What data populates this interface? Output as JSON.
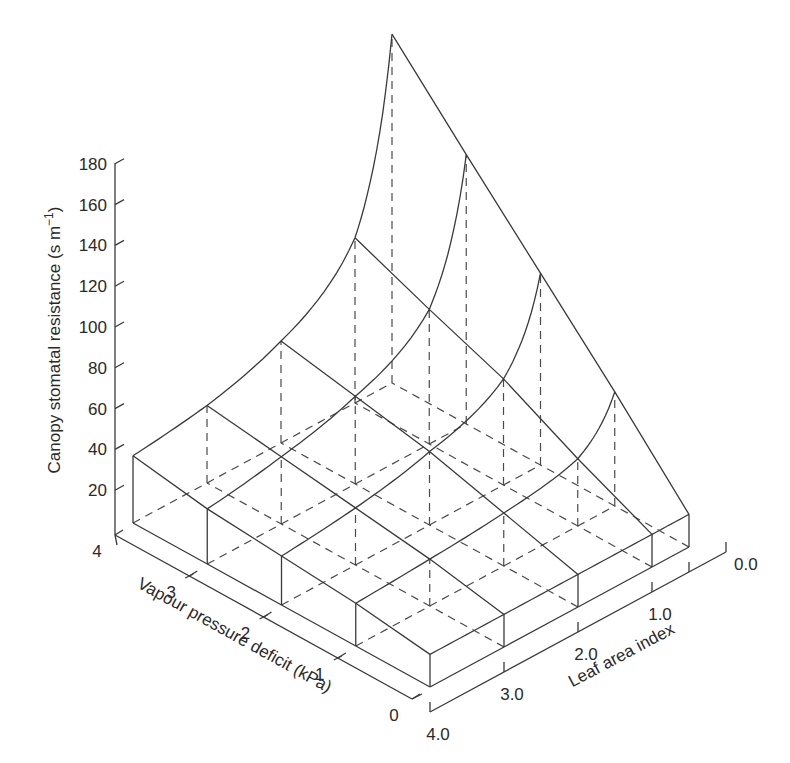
{
  "chart_data": {
    "type": "surface3d",
    "title": "",
    "zlabel": "Canopy stomatal resistance (s m⁻¹)",
    "xlabel": "Vapour pressure deficit (kPa)",
    "ylabel": "Leaf area index",
    "z_ticks": [
      20,
      40,
      60,
      80,
      100,
      120,
      140,
      160,
      180
    ],
    "z_tick_labels": [
      "20",
      "40",
      "60",
      "80",
      "100",
      "120",
      "140",
      "160",
      "180"
    ],
    "x_ticks": [
      0,
      1,
      2,
      3,
      4
    ],
    "x_tick_labels": [
      "0",
      "1",
      "2",
      "3",
      "4"
    ],
    "y_ticks": [
      0.0,
      1.0,
      2.0,
      3.0,
      4.0
    ],
    "y_tick_labels": [
      "0.0",
      "1.0",
      "2.0",
      "3.0",
      "4.0"
    ],
    "zlim": [
      0,
      180
    ],
    "xlim": [
      0,
      4
    ],
    "ylim": [
      0,
      4
    ],
    "grid": false,
    "vpd_values": [
      0,
      1,
      2,
      3,
      4
    ],
    "lai_values": [
      4.0,
      3.0,
      2.0,
      1.0,
      0.5
    ],
    "resistance": [
      [
        16,
        16,
        16,
        16,
        16
      ],
      [
        21,
        23,
        26,
        33,
        56
      ],
      [
        24,
        28,
        36,
        52,
        94
      ],
      [
        27,
        33,
        43,
        66,
        132
      ],
      [
        33,
        38,
        50,
        81,
        171
      ]
    ],
    "resistance_layout": "rows indexed by vpd_values, columns by lai_values"
  },
  "labels": {
    "z_axis_title": "Canopy stomatal resistance (s m",
    "z_axis_sup": "−1",
    "z_axis_close": ")",
    "x_axis_title": "Vapour pressure deficit (kPa)",
    "y_axis_title": "Leaf area index"
  }
}
